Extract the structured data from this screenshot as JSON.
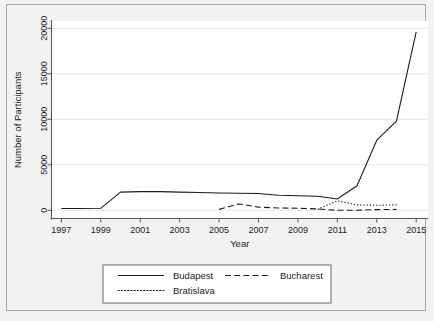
{
  "figure": {
    "background_color": "#f2f2f2",
    "plot_background_color": "#ffffff",
    "frame_color": "#a8a8a8",
    "line_color": "#1c1c1c",
    "grid_color": "#e6e6e6"
  },
  "chart_data": {
    "type": "line",
    "title": "",
    "xlabel": "Year",
    "ylabel": "Number of Participants",
    "xlim": [
      1996.5,
      2015.6
    ],
    "ylim": [
      -900,
      20800
    ],
    "xticks": [
      1997,
      1999,
      2001,
      2003,
      2005,
      2007,
      2009,
      2011,
      2013,
      2015
    ],
    "xtick_labels": [
      "1997",
      "1999",
      "2001",
      "2003",
      "2005",
      "2007",
      "2009",
      "2011",
      "2013",
      "2015"
    ],
    "yticks": [
      0,
      5000,
      10000,
      15000,
      20000
    ],
    "ytick_labels": [
      "0",
      "5000",
      "10000",
      "15000",
      "20000"
    ],
    "grid": true,
    "grid_axis": "y",
    "legend_position": "below-axes",
    "series": [
      {
        "name": "Budapest",
        "style": "solid",
        "x": [
          1997,
          1998,
          1999,
          2000,
          2001,
          2002,
          2003,
          2004,
          2005,
          2006,
          2007,
          2008,
          2009,
          2010,
          2011,
          2012,
          2013,
          2014,
          2015
        ],
        "values": [
          200,
          200,
          220,
          2000,
          2050,
          2050,
          2000,
          1950,
          1900,
          1880,
          1850,
          1650,
          1600,
          1550,
          1250,
          2700,
          7700,
          9800,
          19600
        ]
      },
      {
        "name": "Bucharest",
        "style": "dashed",
        "x": [
          2005,
          2006,
          2007,
          2008,
          2009,
          2010,
          2011,
          2012,
          2013,
          2014
        ],
        "values": [
          100,
          700,
          350,
          250,
          230,
          150,
          0,
          0,
          80,
          100
        ]
      },
      {
        "name": "Bratislava",
        "style": "dotted",
        "x": [
          2010,
          2011,
          2012,
          2013,
          2014
        ],
        "values": [
          100,
          1050,
          600,
          550,
          600
        ]
      }
    ]
  },
  "legend": {
    "entries": [
      {
        "label": "Budapest",
        "style": "solid"
      },
      {
        "label": "Bucharest",
        "style": "dashed"
      },
      {
        "label": "Bratislava",
        "style": "dotted"
      }
    ]
  }
}
